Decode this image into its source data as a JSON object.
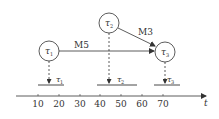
{
  "diagram": {
    "nodes": [
      {
        "id": "tau1",
        "label": "τ",
        "sub": "1",
        "cx": 49,
        "cy": 51,
        "r": 10
      },
      {
        "id": "tau2",
        "label": "τ",
        "sub": "2",
        "cx": 109,
        "cy": 23,
        "r": 10
      },
      {
        "id": "tau3",
        "label": "τ",
        "sub": "3",
        "cx": 165,
        "cy": 52,
        "r": 10
      }
    ],
    "edges": [
      {
        "from": "tau1",
        "to": "tau3",
        "label": "M5"
      },
      {
        "from": "tau2",
        "to": "tau3",
        "label": "M3"
      }
    ],
    "timeline_bars": [
      {
        "label": "τ",
        "sub": "1",
        "x_start": 38,
        "x_end": 64,
        "arrow_x": 49
      },
      {
        "label": "τ",
        "sub": "2",
        "x_start": 97,
        "x_end": 137,
        "arrow_x": 109
      },
      {
        "label": "τ",
        "sub": "3",
        "x_start": 154,
        "x_end": 180,
        "arrow_x": 165
      }
    ],
    "axis": {
      "label": "t",
      "ticks": [
        "10",
        "20",
        "30",
        "40",
        "50",
        "60",
        "70"
      ]
    }
  },
  "labels": {
    "edge_m5": "M5",
    "edge_m3": "M3",
    "node1": "τ",
    "node1_sub": "1",
    "node2": "τ",
    "node2_sub": "2",
    "node3": "τ",
    "node3_sub": "3",
    "bar1": "τ",
    "bar1_sub": "1",
    "bar2": "τ",
    "bar2_sub": "2",
    "bar3": "τ",
    "bar3_sub": "3",
    "axis_t": "t",
    "tick_10": "10",
    "tick_20": "20",
    "tick_30": "30",
    "tick_40": "40",
    "tick_50": "50",
    "tick_60": "60",
    "tick_70": "70"
  }
}
